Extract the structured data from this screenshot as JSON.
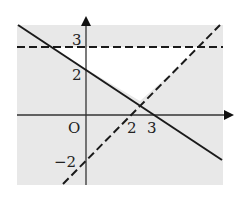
{
  "diagram": {
    "type": "linear-programming-feasible-region",
    "colors": {
      "shade": "#e8e8e8",
      "line": "#1a1a1a",
      "background": "#ffffff"
    },
    "axes": {
      "origin_label": "O",
      "x_ticks": [
        {
          "value": 2,
          "label": "2"
        },
        {
          "value": 3,
          "label": "3"
        }
      ],
      "y_ticks": [
        {
          "value": 3,
          "label": "3"
        },
        {
          "value": 2,
          "label": "2"
        },
        {
          "value": -2,
          "label": "−2"
        }
      ]
    },
    "lines": [
      {
        "name": "2x+3y=6",
        "style": "solid",
        "through": [
          [
            0,
            2
          ],
          [
            3,
            0
          ]
        ]
      },
      {
        "name": "y=x-2",
        "style": "dashed",
        "through": [
          [
            2,
            0
          ],
          [
            0,
            -2
          ]
        ]
      },
      {
        "name": "y=3",
        "style": "dashed",
        "through": [
          [
            0,
            3
          ],
          [
            1,
            3
          ]
        ]
      }
    ],
    "unshaded_region": "triangle bounded by y=3 (dashed), 2x+3y=6 (solid), y=x-2 (dashed)"
  },
  "labels": {
    "origin": "O",
    "x2": "2",
    "x3": "3",
    "y3": "3",
    "y2": "2",
    "yneg2": "−2"
  }
}
